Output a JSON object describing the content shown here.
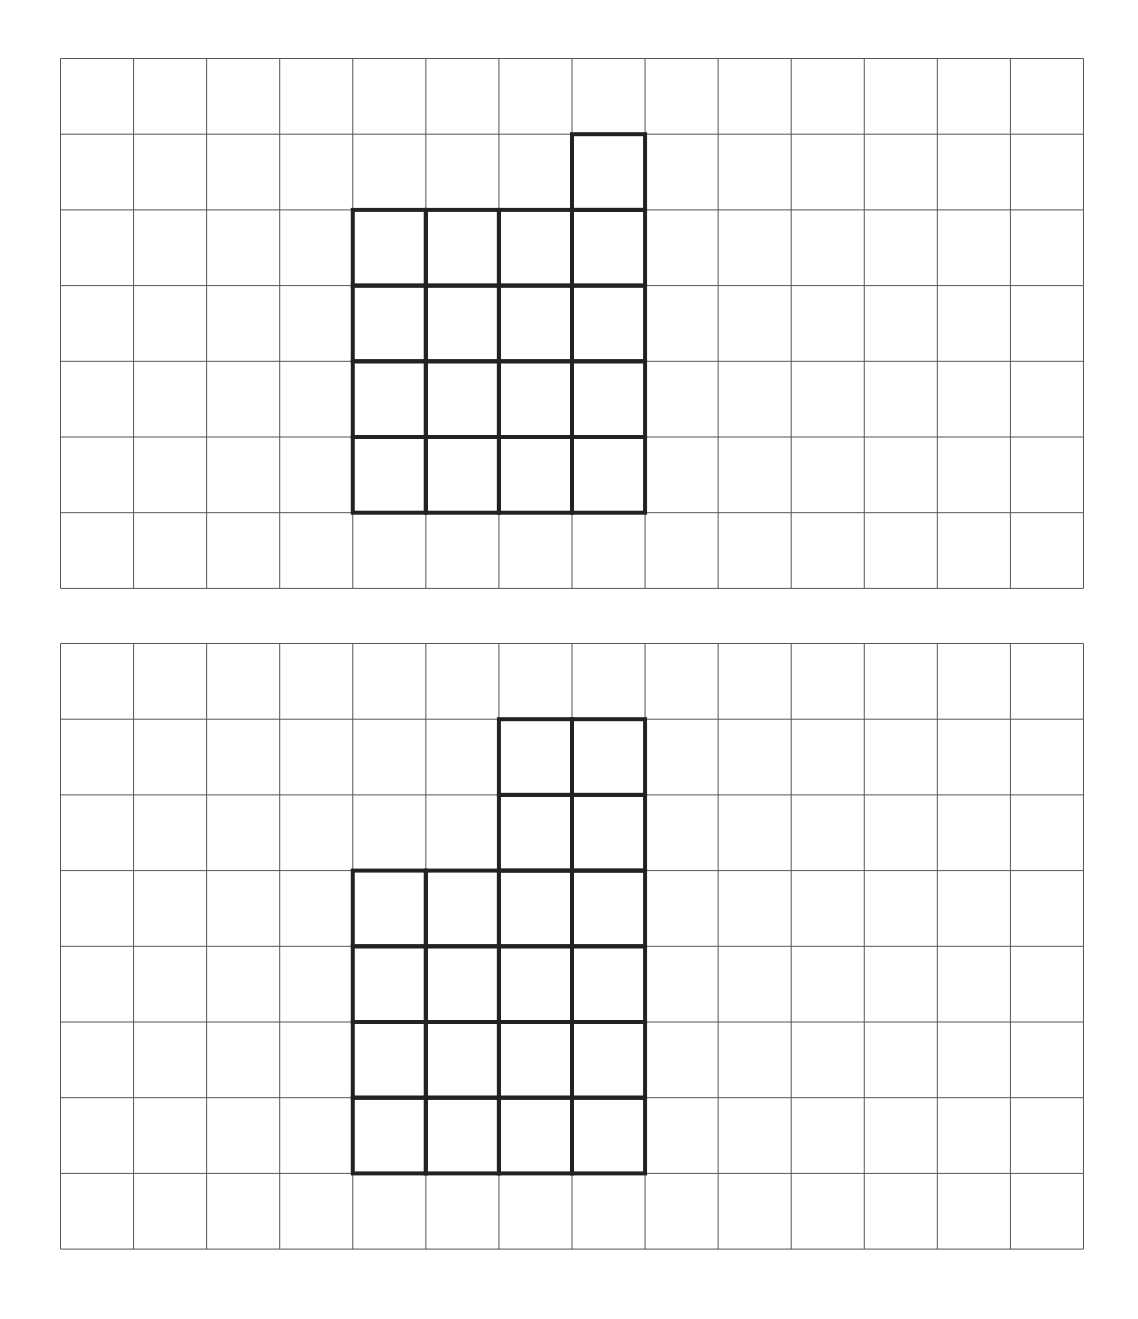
{
  "grids": [
    {
      "id": "grid1",
      "cols": 14,
      "rows": 7,
      "highlighted_cells": [
        [
          1,
          7
        ],
        [
          2,
          4
        ],
        [
          2,
          5
        ],
        [
          2,
          6
        ],
        [
          2,
          7
        ],
        [
          3,
          4
        ],
        [
          3,
          5
        ],
        [
          3,
          6
        ],
        [
          3,
          7
        ],
        [
          4,
          4
        ],
        [
          4,
          5
        ],
        [
          4,
          6
        ],
        [
          4,
          7
        ],
        [
          5,
          4
        ],
        [
          5,
          5
        ],
        [
          5,
          6
        ],
        [
          5,
          7
        ]
      ]
    },
    {
      "id": "grid2",
      "cols": 14,
      "rows": 8,
      "highlighted_cells": [
        [
          1,
          6
        ],
        [
          1,
          7
        ],
        [
          2,
          6
        ],
        [
          2,
          7
        ],
        [
          3,
          4
        ],
        [
          3,
          5
        ],
        [
          3,
          6
        ],
        [
          3,
          7
        ],
        [
          4,
          4
        ],
        [
          4,
          5
        ],
        [
          4,
          6
        ],
        [
          4,
          7
        ],
        [
          5,
          4
        ],
        [
          5,
          5
        ],
        [
          5,
          6
        ],
        [
          5,
          7
        ],
        [
          6,
          4
        ],
        [
          6,
          5
        ],
        [
          6,
          6
        ],
        [
          6,
          7
        ]
      ]
    }
  ],
  "colors": {
    "grid_line": "#555555",
    "shape_outline": "#222222"
  }
}
